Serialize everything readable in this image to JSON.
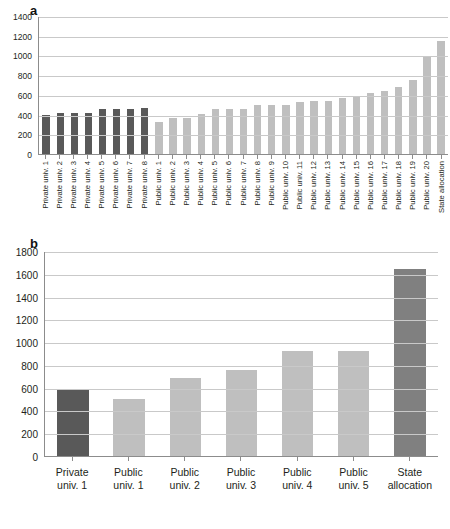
{
  "figure": {
    "panels": [
      {
        "label": "a"
      },
      {
        "label": "b"
      }
    ]
  },
  "chart_data": [
    {
      "id": "chart-a",
      "type": "bar",
      "title": "a",
      "xlabel": "",
      "ylabel": "",
      "ylim": [
        0,
        1400
      ],
      "ytick_step": 200,
      "grid": true,
      "legend": "none",
      "yticks": [
        1400,
        1200,
        1000,
        800,
        600,
        400,
        200,
        0
      ],
      "categories": [
        "Private univ. 1",
        "Private univ. 2",
        "Private univ. 3",
        "Private univ. 4",
        "Private univ. 5",
        "Private univ. 6",
        "Private univ. 7",
        "Private univ. 8",
        "Public univ. 1",
        "Public univ. 2",
        "Public univ. 3",
        "Public univ. 4",
        "Public univ. 5",
        "Public univ. 6",
        "Public univ. 7",
        "Public univ. 8",
        "Public univ. 9",
        "Public univ. 10",
        "Public univ. 11",
        "Public univ. 12",
        "Public univ. 13",
        "Public univ. 14",
        "Public univ. 15",
        "Public univ. 16",
        "Public univ. 17",
        "Public univ. 18",
        "Public univ. 19",
        "Public univ. 20",
        "State allocation"
      ],
      "values": [
        400,
        415,
        415,
        415,
        460,
        460,
        460,
        468,
        320,
        362,
        365,
        410,
        455,
        458,
        458,
        495,
        495,
        495,
        528,
        535,
        542,
        570,
        585,
        615,
        640,
        680,
        755,
        990,
        1145
      ],
      "bar_styles": [
        "dark",
        "dark",
        "dark",
        "dark",
        "dark",
        "dark",
        "dark",
        "dark",
        "light",
        "light",
        "light",
        "light",
        "light",
        "light",
        "light",
        "light",
        "light",
        "light",
        "light",
        "light",
        "light",
        "light",
        "light",
        "light",
        "light",
        "light",
        "light",
        "light",
        "light"
      ]
    },
    {
      "id": "chart-b",
      "type": "bar",
      "title": "b",
      "xlabel": "",
      "ylabel": "",
      "ylim": [
        0,
        1800
      ],
      "ytick_step": 200,
      "grid": true,
      "legend": "none",
      "yticks": [
        1800,
        1600,
        1400,
        1200,
        1000,
        800,
        600,
        400,
        200,
        0
      ],
      "categories": [
        "Private univ. 1",
        "Public univ. 1",
        "Public univ. 2",
        "Public univ. 3",
        "Public univ. 4",
        "Public univ. 5",
        "State allocation"
      ],
      "category_lines": [
        [
          "Private",
          "univ. 1"
        ],
        [
          "Public",
          "univ. 1"
        ],
        [
          "Public",
          "univ. 2"
        ],
        [
          "Public",
          "univ. 3"
        ],
        [
          "Public",
          "univ. 4"
        ],
        [
          "Public",
          "univ. 5"
        ],
        [
          "State",
          "allocation"
        ]
      ],
      "values": [
        580,
        505,
        685,
        755,
        925,
        925,
        1640
      ],
      "bar_styles": [
        "dark",
        "light",
        "light",
        "light",
        "light",
        "light",
        "mid"
      ]
    }
  ],
  "colors": {
    "bar_dark": "#595959",
    "bar_mid": "#808080",
    "bar_light": "#bfbfbf",
    "gridline": "#c9c9c9",
    "axis": "#8c8c8c",
    "text": "#231f20",
    "background": "#ffffff"
  }
}
